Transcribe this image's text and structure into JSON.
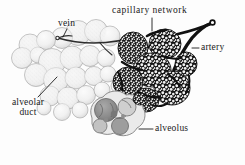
{
  "figure": {
    "background_color": "#fdfdfd",
    "ink_color": "#1a1a1a",
    "width": 245,
    "height": 165
  },
  "labels": {
    "capillary_network": "capillary  network",
    "vein": "vein",
    "artery": "artery",
    "alveolar_duct_line1": "alveolar",
    "alveolar_duct_line2": "duct",
    "alveolus": "alveolus"
  },
  "structures": {
    "pale_alveoli_cluster": {
      "name": "alveolar sac cluster (outline, unshaded)",
      "fill": "#f3f3f3",
      "stroke": "#9a9a9a"
    },
    "capillary_covered_alveoli": {
      "name": "alveoli sheathed in capillary network",
      "fill": "#151515",
      "cell_fill": "#f4f4f4"
    },
    "cut_alveolus": {
      "name": "sectioned alveolus showing internal chambers",
      "fill": "#8b8b8b",
      "stroke": "#6f6f6f"
    },
    "artery_vessel": {
      "name": "pulmonary arteriole",
      "stroke": "#111111"
    },
    "vein_vessel": {
      "name": "pulmonary venule",
      "stroke": "#333333"
    }
  }
}
